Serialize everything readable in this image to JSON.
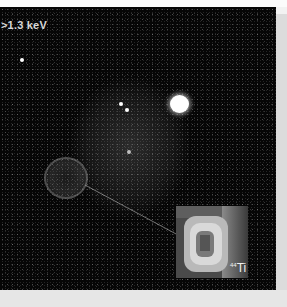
{
  "image": {
    "energy_label": ">1.3 keV",
    "inset_label": {
      "superscript": "44",
      "element": "Ti"
    },
    "colors": {
      "background": "#060606",
      "source": "#ffffff",
      "border": "#dcdcdc"
    }
  }
}
